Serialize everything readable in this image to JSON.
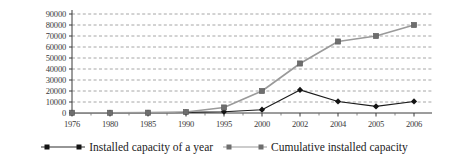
{
  "chart_data": {
    "type": "line",
    "title": "",
    "xlabel": "",
    "ylabel": "",
    "categories": [
      "1976",
      "1980",
      "1985",
      "1990",
      "1995",
      "2000",
      "2002",
      "2004",
      "2005",
      "2006"
    ],
    "ylim": [
      0,
      90000
    ],
    "ytick_values": [
      90000,
      80000,
      70000,
      60000,
      50000,
      40000,
      30000,
      20000,
      10000,
      0
    ],
    "yticks": [
      "90000",
      "80000",
      "70000",
      "60000",
      "50000",
      "40000",
      "30000",
      "20000",
      "10000",
      "0"
    ],
    "grid": true,
    "grid_style": "dashed-horizontal",
    "legend_position": "bottom",
    "series": [
      {
        "name": "Installed capacity of a year",
        "color": "#1b1b1b",
        "marker": "diamond",
        "values": [
          200,
          200,
          200,
          600,
          1200,
          3000,
          21000,
          10500,
          6000,
          10500
        ]
      },
      {
        "name": "Cumulative installed capacity",
        "color": "#9a9a9a",
        "marker": "square",
        "values": [
          200,
          200,
          300,
          900,
          5000,
          20000,
          45000,
          65000,
          70000,
          80000
        ]
      }
    ]
  },
  "legend": {
    "entries": [
      {
        "label": "Installed capacity of a year"
      },
      {
        "label": "Cumulative installed capacity"
      }
    ]
  },
  "axes": {
    "y_axis_name": "y-axis",
    "x_axis_name": "x-axis"
  }
}
